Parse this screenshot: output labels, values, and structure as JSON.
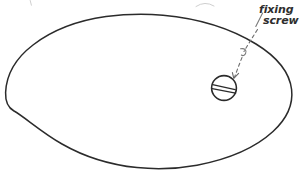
{
  "canvas": {
    "width": 305,
    "height": 177,
    "background_color": "#ffffff",
    "ink_color": "#2b2b2b",
    "leader_color": "#6f6f6f",
    "ghost_color": "#cfcfcf",
    "media": "pencil-on-paper-scan",
    "style": "hand-drawn-sketch"
  },
  "annotations": {
    "label_line_1": "fixing",
    "label_line_2": "screw",
    "label_full": "fixing screw",
    "label_x": 258,
    "label_line_1_y": 13,
    "label_line_2_y": 24
  },
  "shapes": {
    "body_outline": {
      "name": "egg-outline",
      "description": "closed freehand egg / teardrop contour, narrow pointed end at left, broad rounded end at right",
      "leftmost_x": 5,
      "rightmost_x": 292,
      "topmost_y": 14,
      "bottommost_y": 169,
      "apex_top_x": 158,
      "apex_bottom_x": 155,
      "left_tip_y": 92
    },
    "screw_head": {
      "name": "slotted-screw-head",
      "center_x": 224,
      "center_y": 88,
      "radius": 12.5,
      "slot_type": "straight-slot",
      "slot_angle_deg": -12
    },
    "leader": {
      "name": "callout-leader",
      "start_x": 257,
      "start_y": 29,
      "end_x": 234,
      "end_y": 78,
      "has_curl": true,
      "curl_x": 243,
      "curl_y": 53,
      "dashed": true,
      "arrowhead": "open-v"
    },
    "ghost_marks": [
      {
        "name": "cropped-mark-left",
        "x": 31,
        "y": 3
      },
      {
        "name": "cropped-arc-top",
        "x": 205,
        "y": 4
      }
    ]
  }
}
